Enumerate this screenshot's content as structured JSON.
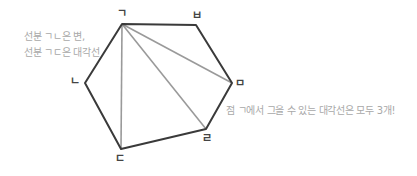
{
  "colors": {
    "edge": "#3a3a3a",
    "diagonal": "#9a9a9a",
    "note_text": "#a8a8a8",
    "label_text": "#444444"
  },
  "hexagon": {
    "vertices": [
      {
        "id": "giyeok",
        "label": "ㄱ",
        "x": 122,
        "y": 24,
        "label_x": 117,
        "label_y": 8
      },
      {
        "id": "bieup",
        "label": "ㅂ",
        "x": 196,
        "y": 25,
        "label_x": 192,
        "label_y": 10
      },
      {
        "id": "mieum",
        "label": "ㅁ",
        "x": 232,
        "y": 83,
        "label_x": 235,
        "label_y": 78
      },
      {
        "id": "rieul",
        "label": "ㄹ",
        "x": 206,
        "y": 129,
        "label_x": 202,
        "label_y": 133
      },
      {
        "id": "digeut",
        "label": "ㄷ",
        "x": 121,
        "y": 149,
        "label_x": 115,
        "label_y": 153
      },
      {
        "id": "nieun",
        "label": "ㄴ",
        "x": 85,
        "y": 83,
        "label_x": 70,
        "label_y": 76
      }
    ],
    "diagonals_from": "ㄱ",
    "diagonals_to": [
      "ㄷ",
      "ㄹ",
      "ㅁ"
    ]
  },
  "notes": {
    "left_line1": "선분 ㄱㄴ은 변,",
    "left_line2": "선분 ㄱㄷ은 대각선",
    "right": "점 ㄱ에서 그을 수 있는 대각선은 모두 3개!"
  }
}
